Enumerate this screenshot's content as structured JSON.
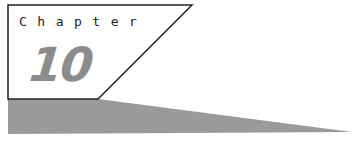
{
  "heading": {
    "label": "Chapter",
    "number": "10"
  },
  "colors": {
    "band": "#9a9a9a",
    "number": "#8c8c8c",
    "border": "#222222"
  }
}
